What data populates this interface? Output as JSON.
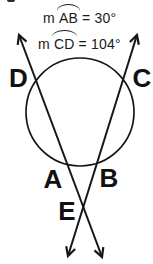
{
  "figure": {
    "background_color": "#ffffff",
    "ink_color": "#1a1a1a",
    "formulas": [
      {
        "prefix": "m",
        "arc_text": "AB",
        "value": "= 30°"
      },
      {
        "prefix": "m",
        "arc_text": "CD",
        "value": "= 104°"
      }
    ],
    "points": {
      "D": "D",
      "C": "C",
      "A": "A",
      "B": "B",
      "E": "E"
    }
  }
}
